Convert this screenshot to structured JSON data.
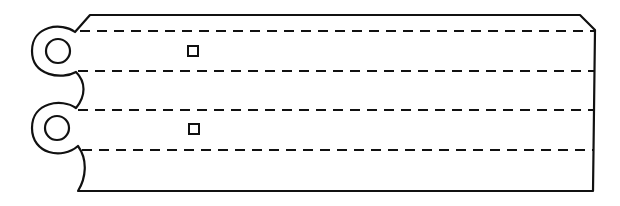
{
  "figure": {
    "stroke_color": "#111111",
    "background_color": "#ffffff",
    "stroke_width": 2.2
  },
  "outline": {
    "path": "M 75 32 L 90 15 L 580 15 L 595 30 L 593 191 L 78 191 C 86 178, 88 160, 78 146 C 62 160, 32 154, 32 128 C 32 102, 62 98, 76 108 C 86 96, 86 82, 76 72 C 62 80, 32 76, 32 51 C 32 25, 62 22, 75 32 Z"
  },
  "lugs": [
    {
      "name": "upper-lug",
      "hole": {
        "cx": 58,
        "cy": 51,
        "r": 12
      }
    },
    {
      "name": "lower-lug",
      "hole": {
        "cx": 57,
        "cy": 128,
        "r": 12
      }
    }
  ],
  "perforation_lines": [
    {
      "x1": 80,
      "x2": 594,
      "y": 31
    },
    {
      "x1": 78,
      "x2": 594,
      "y": 71
    },
    {
      "x1": 78,
      "x2": 594,
      "y": 110
    },
    {
      "x1": 82,
      "x2": 594,
      "y": 150
    }
  ],
  "markers": [
    {
      "x": 188,
      "y": 46,
      "size": 10
    },
    {
      "x": 189,
      "y": 124,
      "size": 10
    }
  ],
  "dash_pattern": "10 7"
}
